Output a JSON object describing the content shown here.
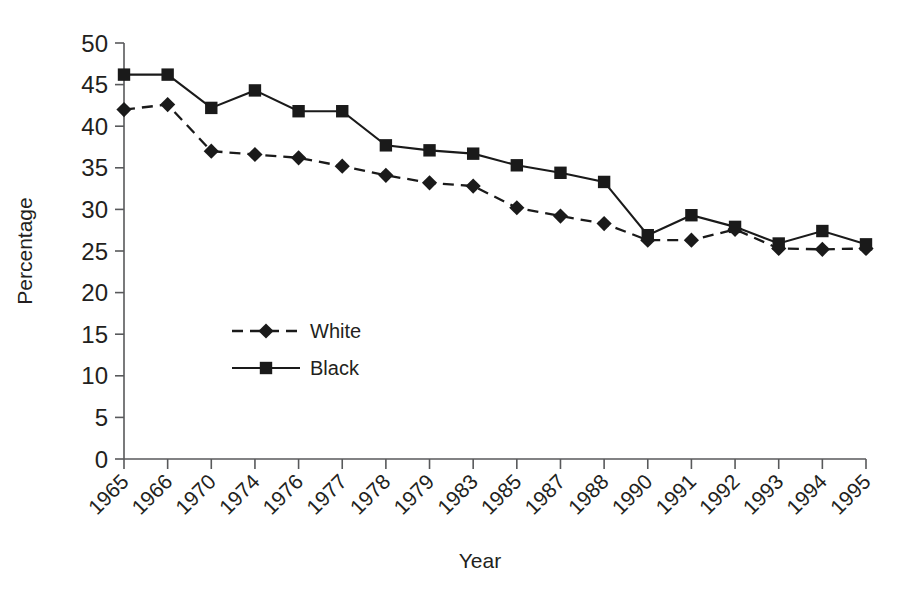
{
  "chart_data": {
    "type": "line",
    "title": "",
    "xlabel": "Year",
    "ylabel": "Percentage",
    "categories": [
      "1965",
      "1966",
      "1970",
      "1974",
      "1976",
      "1977",
      "1978",
      "1979",
      "1983",
      "1985",
      "1987",
      "1988",
      "1990",
      "1991",
      "1992",
      "1993",
      "1994",
      "1995"
    ],
    "series": [
      {
        "name": "White",
        "marker": "diamond",
        "linestyle": "dashed",
        "color": "#1a1a1a",
        "values": [
          42.0,
          42.6,
          37.0,
          36.6,
          36.2,
          35.2,
          34.1,
          33.2,
          32.8,
          30.2,
          29.2,
          28.3,
          26.3,
          26.3,
          27.6,
          25.3,
          25.2,
          25.3
        ]
      },
      {
        "name": "Black",
        "marker": "square",
        "linestyle": "solid",
        "color": "#1a1a1a",
        "values": [
          46.2,
          46.2,
          42.2,
          44.3,
          41.8,
          41.8,
          37.7,
          37.1,
          36.7,
          35.3,
          34.4,
          33.3,
          26.9,
          29.3,
          27.9,
          25.9,
          27.4,
          25.8
        ]
      }
    ],
    "ylim": [
      0,
      50
    ],
    "yticks": [
      0,
      5,
      10,
      15,
      20,
      25,
      30,
      35,
      40,
      45,
      50
    ],
    "ytick_labels": [
      "0",
      "5",
      "10",
      "15",
      "20",
      "25",
      "30",
      "35",
      "40",
      "45",
      "50"
    ],
    "grid": false,
    "legend_position": "inside-left-lower",
    "xtick_label_rotation": -45
  },
  "legend": {
    "entries": [
      {
        "label": "White",
        "style": "dashed-diamond"
      },
      {
        "label": "Black",
        "style": "solid-square"
      }
    ]
  },
  "axes": {
    "y_axis_title": "Percentage",
    "x_axis_title": "Year"
  }
}
